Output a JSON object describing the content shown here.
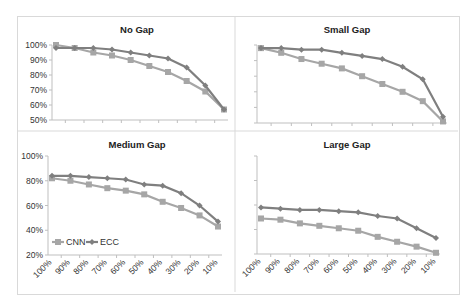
{
  "colors": {
    "cnn": "#a6a6a6",
    "ecc": "#7f7f7f",
    "axis": "#bfbfbf",
    "divider": "#d9d9d9"
  },
  "legend": {
    "cnn_label": "CNN",
    "ecc_label": "ECC"
  },
  "chart_data": [
    {
      "type": "line",
      "title": "No Gap",
      "categories": [
        "100%",
        "90%",
        "80%",
        "70%",
        "60%",
        "50%",
        "40%",
        "30%",
        "20%",
        "10%"
      ],
      "ylim": [
        50,
        100
      ],
      "yticks": [
        "100%",
        "90%",
        "80%",
        "70%",
        "60%",
        "50%"
      ],
      "series": [
        {
          "name": "CNN",
          "values": [
            100,
            98,
            95,
            93,
            90,
            86,
            82,
            76,
            69,
            57
          ]
        },
        {
          "name": "ECC",
          "values": [
            98,
            98,
            98,
            97,
            95,
            93,
            91,
            85,
            73,
            57
          ]
        }
      ],
      "xlabel": "",
      "ylabel": "",
      "grid": false
    },
    {
      "type": "line",
      "title": "Small Gap",
      "categories": [
        "100%",
        "90%",
        "80%",
        "70%",
        "60%",
        "50%",
        "40%",
        "30%",
        "20%",
        "10%"
      ],
      "ylim": [
        50,
        100
      ],
      "series": [
        {
          "name": "CNN",
          "values": [
            98,
            95,
            91,
            88,
            85,
            80,
            75,
            70,
            64,
            51
          ]
        },
        {
          "name": "ECC",
          "values": [
            98,
            98,
            97,
            97,
            95,
            93,
            91,
            86,
            78,
            54
          ]
        }
      ],
      "xlabel": "",
      "ylabel": "",
      "grid": false
    },
    {
      "type": "line",
      "title": "Medium Gap",
      "categories": [
        "100%",
        "90%",
        "80%",
        "70%",
        "60%",
        "50%",
        "40%",
        "30%",
        "20%",
        "10%"
      ],
      "ylim": [
        20,
        100
      ],
      "yticks": [
        "100%",
        "80%",
        "60%",
        "40%",
        "20%"
      ],
      "series": [
        {
          "name": "CNN",
          "values": [
            82,
            80,
            77,
            74,
            72,
            69,
            63,
            58,
            52,
            43
          ]
        },
        {
          "name": "ECC",
          "values": [
            84,
            84,
            83,
            82,
            81,
            77,
            76,
            70,
            60,
            47
          ]
        }
      ],
      "legend": [
        "CNN",
        "ECC"
      ],
      "legend_position": "lower left",
      "xlabel": "",
      "ylabel": "",
      "grid": false
    },
    {
      "type": "line",
      "title": "Large Gap",
      "categories": [
        "100%",
        "90%",
        "80%",
        "70%",
        "60%",
        "50%",
        "40%",
        "30%",
        "20%",
        "10%"
      ],
      "ylim": [
        20,
        100
      ],
      "series": [
        {
          "name": "CNN",
          "values": [
            49,
            48,
            45,
            43,
            41,
            39,
            34,
            30,
            26,
            21
          ]
        },
        {
          "name": "ECC",
          "values": [
            58,
            57,
            56,
            56,
            55,
            54,
            51,
            49,
            41,
            33
          ]
        }
      ],
      "xlabel": "",
      "ylabel": "",
      "grid": false
    }
  ]
}
